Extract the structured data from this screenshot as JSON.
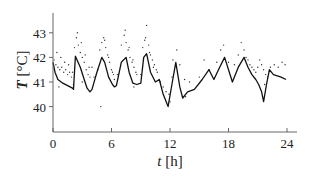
{
  "chart_data": {
    "type": "line",
    "title": "",
    "xlabel": "t [h]",
    "ylabel": "T [°C]",
    "xlim": [
      0,
      24.8
    ],
    "ylim": [
      39.0,
      44.0
    ],
    "xticks": [
      0,
      6,
      12,
      18,
      24
    ],
    "yticks": [
      40,
      41,
      42,
      43
    ],
    "grid": false,
    "legend": null,
    "series": [
      {
        "name": "model",
        "style": "line",
        "color": "#111111",
        "x": [
          0.0,
          0.2,
          0.5,
          1.0,
          1.5,
          2.0,
          2.1,
          2.3,
          2.8,
          3.2,
          3.5,
          3.8,
          4.0,
          4.5,
          5.0,
          5.3,
          5.7,
          6.1,
          6.3,
          6.5,
          7.0,
          7.5,
          7.8,
          8.2,
          8.6,
          9.0,
          9.3,
          9.6,
          10.0,
          10.5,
          10.9,
          11.3,
          11.8,
          12.2,
          12.6,
          13.0,
          13.3,
          13.8,
          14.5,
          15.3,
          16.0,
          16.5,
          17.1,
          17.6,
          18.4,
          19.0,
          19.6,
          20.0,
          20.4,
          20.8,
          21.1,
          21.4,
          21.6,
          21.9,
          22.2,
          22.6,
          23.0,
          23.4,
          23.9
        ],
        "y": [
          41.8,
          41.4,
          41.1,
          40.95,
          40.85,
          40.75,
          40.7,
          42.05,
          41.6,
          41.1,
          40.75,
          40.6,
          40.7,
          41.4,
          42.0,
          41.8,
          41.2,
          40.9,
          40.8,
          40.85,
          41.8,
          42.0,
          41.4,
          40.95,
          40.9,
          40.95,
          42.0,
          42.15,
          41.4,
          41.0,
          41.1,
          40.5,
          40.0,
          40.9,
          41.8,
          40.8,
          40.35,
          40.6,
          40.7,
          41.1,
          41.5,
          41.1,
          41.6,
          42.0,
          41.0,
          41.6,
          42.0,
          41.6,
          41.3,
          41.1,
          40.9,
          40.6,
          40.2,
          40.9,
          41.5,
          41.3,
          41.25,
          41.2,
          41.1
        ]
      },
      {
        "name": "measured",
        "style": "scatter",
        "color": "#333333",
        "x": [
          0.1,
          0.3,
          0.5,
          0.7,
          0.9,
          1.1,
          1.3,
          1.5,
          1.7,
          1.9,
          0.4,
          0.8,
          1.2,
          1.6,
          2.0,
          2.2,
          2.4,
          2.6,
          2.8,
          3.0,
          3.2,
          3.4,
          3.6,
          3.8,
          2.5,
          2.9,
          3.3,
          3.7,
          4.2,
          4.6,
          5.0,
          5.2,
          5.4,
          5.6,
          5.8,
          6.0,
          6.2,
          4.8,
          5.3,
          5.7,
          6.1,
          6.6,
          7.0,
          7.3,
          7.5,
          7.7,
          7.9,
          8.1,
          8.3,
          8.5,
          7.4,
          7.8,
          8.2,
          8.6,
          9.0,
          9.2,
          9.4,
          9.6,
          9.8,
          10.0,
          10.2,
          10.4,
          10.6,
          9.5,
          9.9,
          10.3,
          10.7,
          11.0,
          11.3,
          11.6,
          12.0,
          12.3,
          12.7,
          13.0,
          13.5,
          14.0,
          15.0,
          16.0,
          16.8,
          17.2,
          17.5,
          18.0,
          18.6,
          19.0,
          19.3,
          19.6,
          19.8,
          20.0,
          20.2,
          20.4,
          20.6,
          20.8,
          21.0,
          21.2,
          21.4,
          21.6,
          21.8,
          22.0,
          22.3,
          22.7,
          23.1,
          23.5,
          23.8,
          2.1,
          3.0,
          0.6,
          4.0,
          4.9,
          8.3,
          6.3,
          12.2,
          11.9,
          13.6,
          15.5,
          21.7
        ],
        "y": [
          41.9,
          41.7,
          41.6,
          41.5,
          41.6,
          41.4,
          41.5,
          41.3,
          41.4,
          41.2,
          42.2,
          42.0,
          41.8,
          41.7,
          41.4,
          42.4,
          42.8,
          42.5,
          42.2,
          42.0,
          41.8,
          41.5,
          41.3,
          41.2,
          43.0,
          42.6,
          42.1,
          41.6,
          41.2,
          41.5,
          42.6,
          42.8,
          42.4,
          42.1,
          41.8,
          41.5,
          41.3,
          42.3,
          42.7,
          42.0,
          41.4,
          41.3,
          42.5,
          42.9,
          42.6,
          42.3,
          42.0,
          41.8,
          41.6,
          41.4,
          43.1,
          42.4,
          41.9,
          41.3,
          41.3,
          42.4,
          42.7,
          43.3,
          42.5,
          42.1,
          41.9,
          41.7,
          41.5,
          42.8,
          42.2,
          41.6,
          41.4,
          41.0,
          40.8,
          40.6,
          40.2,
          41.9,
          42.3,
          41.7,
          41.1,
          41.0,
          41.2,
          41.5,
          41.8,
          42.3,
          42.5,
          41.8,
          41.7,
          42.1,
          42.6,
          42.3,
          42.0,
          41.9,
          41.7,
          41.6,
          41.5,
          41.4,
          41.6,
          41.9,
          41.7,
          41.5,
          41.3,
          41.2,
          41.6,
          41.7,
          41.6,
          41.8,
          41.7,
          40.9,
          41.0,
          40.8,
          41.6,
          40.0,
          40.8,
          41.1,
          41.2,
          40.5,
          40.4,
          41.9,
          40.9
        ]
      }
    ]
  },
  "axes": {
    "xlabel_italic": "t",
    "xlabel_unit": " [h]",
    "ylabel_italic": "T",
    "ylabel_unit": " [°C]",
    "xtick_labels": [
      "0",
      "6",
      "12",
      "18",
      "24"
    ],
    "ytick_labels": [
      "40",
      "41",
      "42",
      "43"
    ]
  }
}
